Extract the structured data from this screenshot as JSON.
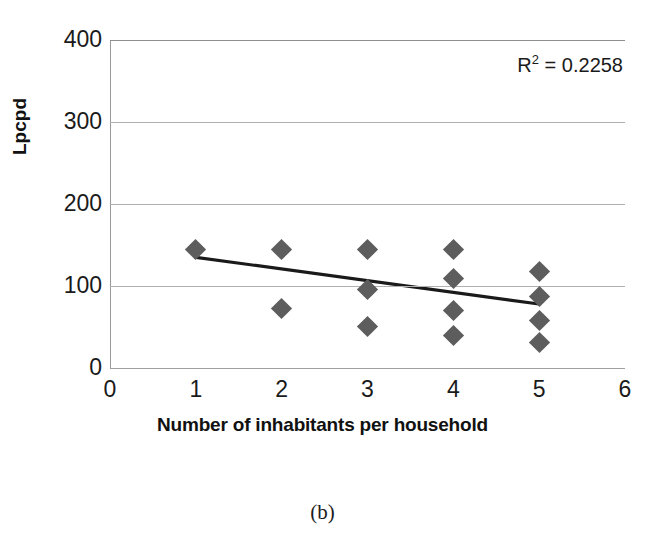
{
  "chart_data": {
    "type": "scatter",
    "title": "",
    "xlabel": "Number of inhabitants per household",
    "ylabel": "Lpcpd",
    "xlim": [
      0,
      6
    ],
    "ylim": [
      0,
      400
    ],
    "xticks": [
      0,
      1,
      2,
      3,
      4,
      5,
      6
    ],
    "yticks": [
      0,
      100,
      200,
      300,
      400
    ],
    "grid": "horizontal",
    "legend": "none",
    "annotations": [
      {
        "text": "R² = 0.2258",
        "base": "R",
        "sup": "2",
        "rest": " = 0.2258"
      }
    ],
    "series": [
      {
        "name": "observations",
        "marker": "diamond",
        "color": "#5d5d5d",
        "points": [
          {
            "x": 1,
            "y": 145
          },
          {
            "x": 2,
            "y": 145
          },
          {
            "x": 2,
            "y": 73
          },
          {
            "x": 3,
            "y": 145
          },
          {
            "x": 3,
            "y": 96
          },
          {
            "x": 3,
            "y": 51
          },
          {
            "x": 4,
            "y": 145
          },
          {
            "x": 4,
            "y": 109
          },
          {
            "x": 4,
            "y": 70
          },
          {
            "x": 4,
            "y": 40
          },
          {
            "x": 5,
            "y": 118
          },
          {
            "x": 5,
            "y": 87
          },
          {
            "x": 5,
            "y": 58
          },
          {
            "x": 5,
            "y": 31
          }
        ]
      }
    ],
    "trendline": {
      "name": "linear-fit",
      "color": "#1a1a1a",
      "r_squared": 0.2258,
      "x_start": 1,
      "y_start": 135,
      "x_end": 5,
      "y_end": 78
    }
  },
  "caption": {
    "label": "(b)"
  },
  "axis": {
    "y_title": "Lpcpd",
    "x_title": "Number of inhabitants per household",
    "y_tick_labels": [
      "400",
      "300",
      "200",
      "100",
      "0"
    ],
    "x_tick_labels": [
      "0",
      "1",
      "2",
      "3",
      "4",
      "5",
      "6"
    ]
  },
  "colors": {
    "marker": "#5d5d5d",
    "trendline": "#1a1a1a",
    "gridline": "#b0b0b0",
    "text": "#1a1a1a",
    "background": "#ffffff"
  }
}
